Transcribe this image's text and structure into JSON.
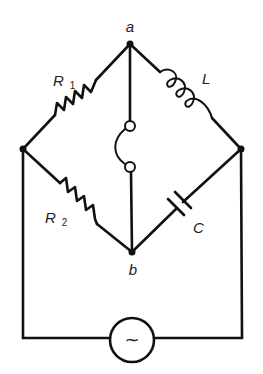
{
  "diagram": {
    "type": "AC bridge circuit",
    "nodes": {
      "a": {
        "label": "a"
      },
      "b": {
        "label": "b"
      },
      "left": {
        "label": ""
      },
      "right": {
        "label": ""
      }
    },
    "components": {
      "r1": {
        "label": "R",
        "subscript": "1",
        "kind": "resistor",
        "branch": "left-node to a"
      },
      "l": {
        "label": "L",
        "kind": "inductor",
        "branch": "a to right-node"
      },
      "r2": {
        "label": "R",
        "subscript": "2",
        "kind": "resistor",
        "branch": "left-node to b"
      },
      "c": {
        "label": "C",
        "kind": "capacitor",
        "branch": "b to right-node"
      },
      "detector": {
        "label": "",
        "kind": "detector",
        "branch": "a to b"
      },
      "source": {
        "label": "~",
        "kind": "ac-source",
        "branch": "left-node to right-node (bottom)"
      }
    },
    "colors": {
      "line": "#111111",
      "background": "#ffffff"
    }
  }
}
